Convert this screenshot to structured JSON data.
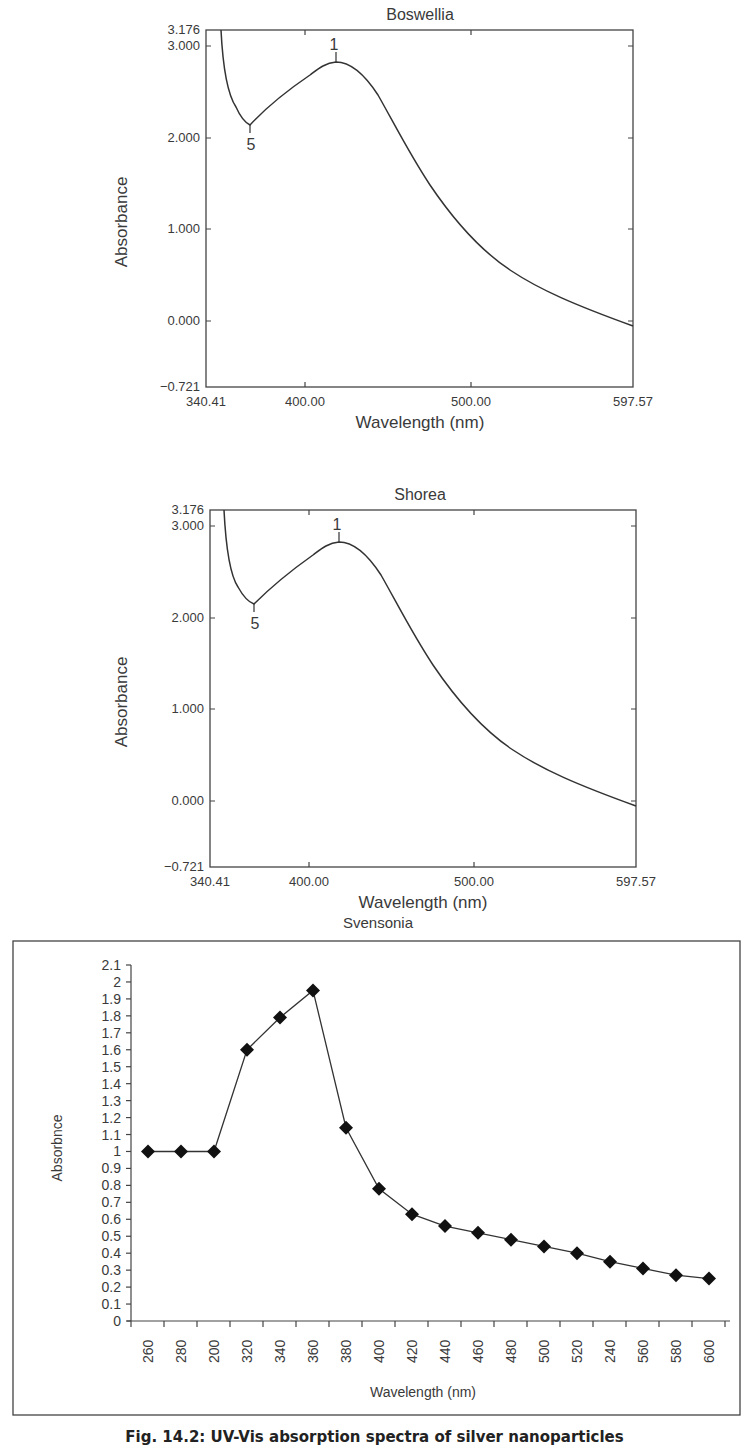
{
  "figure": {
    "caption": "Fig. 14.2: UV-Vis absorption spectra of silver nanoparticles"
  },
  "charts": [
    {
      "title": "Boswellia",
      "xlabel": "Wavelength (nm)",
      "ylabel": "Absorbance",
      "x_ticks": [
        "340.41",
        "400.00",
        "500.00",
        "597.57"
      ],
      "y_ticks": [
        "3.176",
        "3.000",
        "2.000",
        "1.000",
        "0.000",
        "−0.721"
      ],
      "peak_labels": [
        "1",
        "5"
      ]
    },
    {
      "title": "Shorea",
      "xlabel": "Wavelength (nm)",
      "ylabel": "Absorbance",
      "x_ticks": [
        "340.41",
        "400.00",
        "500.00",
        "597.57"
      ],
      "y_ticks": [
        "3.176",
        "3.000",
        "2.000",
        "1.000",
        "0.000",
        "−0.721"
      ],
      "peak_labels": [
        "1",
        "5"
      ]
    },
    {
      "title": "Svensonia",
      "xlabel": "Wavelength (nm)",
      "ylabel": "Absorbnce",
      "x_ticks": [
        "260",
        "280",
        "200",
        "320",
        "340",
        "360",
        "380",
        "400",
        "420",
        "440",
        "460",
        "480",
        "500",
        "520",
        "240",
        "560",
        "580",
        "600"
      ],
      "y_ticks": [
        "2.1",
        "2",
        "1.9",
        "1.8",
        "1.7",
        "1.6",
        "1.5",
        "1.4",
        "1.3",
        "1.2",
        "1.1",
        "1",
        "0.9",
        "0.8",
        "0.7",
        "0.6",
        "0.5",
        "0.4",
        "0.3",
        "0.2",
        "0.1",
        "0"
      ]
    }
  ],
  "chart_data": [
    {
      "type": "line",
      "title": "Boswellia",
      "xlabel": "Wavelength (nm)",
      "ylabel": "Absorbance",
      "xlim": [
        340.41,
        597.57
      ],
      "ylim": [
        -0.721,
        3.176
      ],
      "grid": false,
      "x": [
        343,
        350,
        360,
        370,
        380,
        390,
        400,
        410,
        420,
        430,
        440,
        450,
        460,
        470,
        480,
        490,
        500,
        520,
        540,
        560,
        580,
        597.57
      ],
      "values": [
        3.176,
        2.5,
        2.15,
        2.1,
        2.3,
        2.5,
        2.67,
        2.77,
        2.78,
        2.7,
        2.5,
        2.2,
        1.9,
        1.63,
        1.4,
        1.2,
        1.03,
        0.76,
        0.56,
        0.42,
        0.32,
        0.26
      ],
      "annotations": [
        {
          "label": "1",
          "x": 416,
          "y": 2.8,
          "note": "peak"
        },
        {
          "label": "5",
          "x": 369,
          "y": 2.1,
          "note": "valley"
        }
      ]
    },
    {
      "type": "line",
      "title": "Shorea",
      "xlabel": "Wavelength (nm)",
      "ylabel": "Absorbance",
      "xlim": [
        340.41,
        597.57
      ],
      "ylim": [
        -0.721,
        3.176
      ],
      "grid": false,
      "x": [
        343,
        350,
        360,
        370,
        380,
        390,
        400,
        410,
        420,
        430,
        440,
        450,
        460,
        470,
        480,
        490,
        500,
        520,
        540,
        560,
        580,
        597.57
      ],
      "values": [
        3.176,
        2.5,
        2.15,
        2.12,
        2.3,
        2.5,
        2.67,
        2.77,
        2.79,
        2.7,
        2.5,
        2.2,
        1.9,
        1.63,
        1.4,
        1.2,
        1.03,
        0.76,
        0.56,
        0.42,
        0.32,
        0.26
      ],
      "annotations": [
        {
          "label": "1",
          "x": 416,
          "y": 2.8,
          "note": "peak"
        },
        {
          "label": "5",
          "x": 369,
          "y": 2.12,
          "note": "valley"
        }
      ]
    },
    {
      "type": "line",
      "title": "Svensonia",
      "xlabel": "Wavelength (nm)",
      "ylabel": "Absorbnce",
      "categories": [
        "260",
        "280",
        "200",
        "320",
        "340",
        "360",
        "380",
        "400",
        "420",
        "440",
        "460",
        "480",
        "500",
        "520",
        "240",
        "560",
        "580",
        "600"
      ],
      "values": [
        1.0,
        1.0,
        1.0,
        1.6,
        1.79,
        1.95,
        1.14,
        0.78,
        0.63,
        0.56,
        0.52,
        0.48,
        0.44,
        0.4,
        0.35,
        0.31,
        0.27,
        0.25
      ],
      "ylim": [
        0,
        2.1
      ],
      "marker": "diamond",
      "grid": false,
      "legend": "none"
    }
  ]
}
